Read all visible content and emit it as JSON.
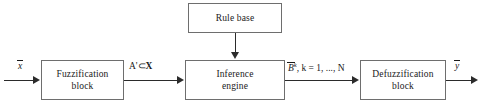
{
  "diagram": {
    "background_color": "#ffffff",
    "border_color": "#6e6e6e",
    "line_color": "#2b2b2b",
    "blocks": [
      {
        "id": "rule_base",
        "label": "Rule base"
      },
      {
        "id": "fuzzification",
        "label": "Fuzzification\nblock"
      },
      {
        "id": "inference",
        "label": "Inference\nengine"
      },
      {
        "id": "defuzzification",
        "label": "Defuzzification\nblock"
      }
    ],
    "labels": {
      "input_x": "x",
      "fuzzy_set_a": "A'",
      "subset_symbol": "⊂",
      "universe_x": "X",
      "output_b": "B",
      "output_b_superscript": "k",
      "output_b_range": ", k = 1, ..., N",
      "output_y": "y"
    }
  }
}
